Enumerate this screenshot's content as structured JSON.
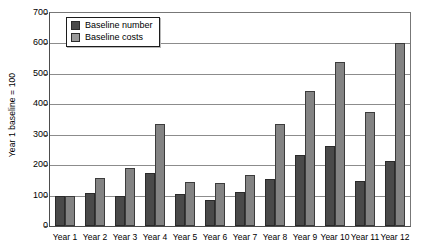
{
  "chart_data": {
    "type": "bar",
    "title": "",
    "xlabel": "",
    "ylabel": "Year 1 baseline = 100",
    "ylim": [
      0,
      700
    ],
    "ytick_step": 100,
    "yticks": [
      700,
      600,
      500,
      400,
      300,
      200,
      100,
      0
    ],
    "grid": true,
    "legend_position": "top-left",
    "categories": [
      "Year 1",
      "Year 2",
      "Year 3",
      "Year 4",
      "Year 5",
      "Year 6",
      "Year 7",
      "Year 8",
      "Year 9",
      "Year 10",
      "Year 11",
      "Year 12"
    ],
    "series": [
      {
        "name": "Baseline number",
        "color": "#4a4a4a",
        "values": [
          100,
          108,
          100,
          175,
          105,
          85,
          112,
          155,
          235,
          262,
          148,
          213
        ]
      },
      {
        "name": "Baseline costs",
        "color": "#838383",
        "values": [
          100,
          158,
          192,
          335,
          145,
          140,
          168,
          335,
          445,
          540,
          375,
          600
        ]
      }
    ]
  }
}
